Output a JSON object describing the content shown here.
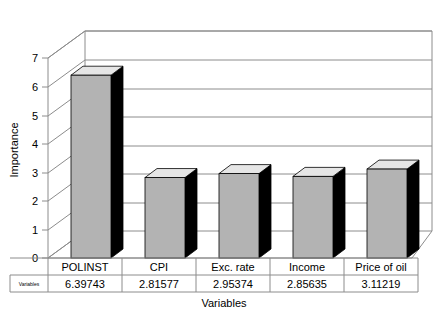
{
  "chart_data": {
    "type": "bar",
    "title": "",
    "xlabel": "Variables",
    "ylabel": "Importance",
    "categories": [
      "POLINST",
      "CPI",
      "Exc. rate",
      "Income",
      "Price of oil"
    ],
    "values": [
      6.39743,
      2.81577,
      2.95374,
      2.85635,
      3.11219
    ],
    "value_labels": [
      "6.39743",
      "2.81577",
      "2.95374",
      "2.85635",
      "3.11219"
    ],
    "series": [
      {
        "name": "Variables",
        "values": [
          6.39743,
          2.81577,
          2.95374,
          2.85635,
          3.11219
        ]
      }
    ],
    "ylim": [
      0,
      7
    ],
    "yticks": [
      0,
      1,
      2,
      3,
      4,
      5,
      6,
      7
    ],
    "ytick_labels": [
      "0",
      "1",
      "2",
      "3",
      "4",
      "5",
      "6",
      "7"
    ],
    "grid": true,
    "legend": "none",
    "style": "3d-bar",
    "colors": {
      "bar_front": "#b3b3b3",
      "bar_top": "#e6e6e6",
      "bar_side": "#000000",
      "gridline": "#8c8c8c",
      "text": "#000000",
      "background": "#ffffff"
    }
  },
  "data_table": {
    "row_header": "Variables",
    "column_headers": [
      "POLINST",
      "CPI",
      "Exc. rate",
      "Income",
      "Price of oil"
    ],
    "rows": [
      {
        "label": "Variables",
        "cells": [
          "6.39743",
          "2.81577",
          "2.95374",
          "2.85635",
          "3.11219"
        ]
      }
    ]
  },
  "axes": {
    "y_title": "Importance",
    "x_title": "Variables"
  }
}
